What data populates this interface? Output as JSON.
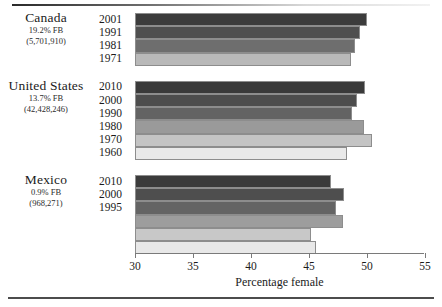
{
  "chart_data": {
    "type": "bar",
    "orientation": "horizontal",
    "title": "",
    "xlabel": "Percentage female",
    "ylabel": "",
    "xlim": [
      30,
      55
    ],
    "xticks": [
      30,
      35,
      40,
      45,
      50,
      55
    ],
    "grid": false,
    "legend": "none",
    "groups": [
      {
        "name": "Canada",
        "pct_fb": "19.2% FB",
        "count": "(5,701,910)",
        "categories": [
          "2001",
          "1991",
          "1981",
          "1971"
        ],
        "values": [
          50.0,
          49.4,
          49.0,
          48.6
        ],
        "shades": [
          "#3c3c3c",
          "#4f4f4f",
          "#6e6e6e",
          "#b9b9b9"
        ]
      },
      {
        "name": "United States",
        "pct_fb": "13.7% FB",
        "count": "(42,428,246)",
        "categories": [
          "2010",
          "2000",
          "1990",
          "1980",
          "1970",
          "1960"
        ],
        "values": [
          49.8,
          49.1,
          48.7,
          49.7,
          50.4,
          48.3
        ],
        "shades": [
          "#3a3a3a",
          "#4d4d4d",
          "#636363",
          "#9a9a9a",
          "#c4c4c4",
          "#e9e9e9"
        ]
      },
      {
        "name": "Mexico",
        "pct_fb": "0.9% FB",
        "count": "(968,271)",
        "categories": [
          "2010",
          "2000",
          "1995",
          "",
          "",
          ""
        ],
        "values": [
          46.9,
          48.0,
          47.3,
          47.9,
          45.2,
          45.6
        ],
        "shades": [
          "#3b3b3b",
          "#4e4e4e",
          "#646464",
          "#9d9d9d",
          "#c8c8c8",
          "#e8e8e8"
        ]
      }
    ]
  },
  "axis": {
    "tick_labels": [
      "30",
      "35",
      "40",
      "45",
      "50",
      "55"
    ],
    "x_axis_title": "Percentage female"
  }
}
